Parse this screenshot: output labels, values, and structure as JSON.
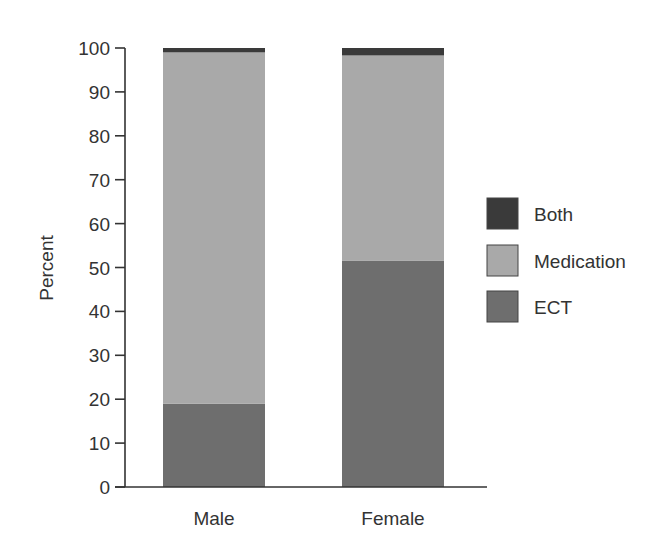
{
  "chart_data": {
    "type": "bar",
    "stacked": true,
    "title": "",
    "xlabel": "",
    "ylabel": "Percent",
    "ylim": [
      0,
      100
    ],
    "yticks": [
      0,
      10,
      20,
      30,
      40,
      50,
      60,
      70,
      80,
      90,
      100
    ],
    "categories": [
      "Male",
      "Female"
    ],
    "series": [
      {
        "name": "ECT",
        "color": "#6e6e6e",
        "values": [
          19,
          51.5
        ]
      },
      {
        "name": "Medication",
        "color": "#a9a9a9",
        "values": [
          80,
          46.8
        ]
      },
      {
        "name": "Both",
        "color": "#3a3a3a",
        "values": [
          1,
          1.7
        ]
      }
    ],
    "legend": {
      "position": "right",
      "entries": [
        {
          "name": "Both",
          "color": "#3a3a3a"
        },
        {
          "name": "Medication",
          "color": "#a9a9a9"
        },
        {
          "name": "ECT",
          "color": "#6e6e6e"
        }
      ]
    },
    "grid": false
  }
}
